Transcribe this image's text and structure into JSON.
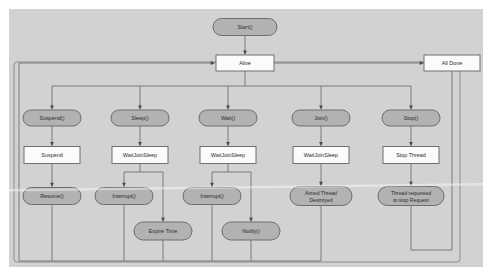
{
  "diagram": {
    "type": "flowchart",
    "canvas": {
      "background_color": "#d2d2d2",
      "page_background_color": "#ffffff",
      "frame_stroke_color": "#8c8c8c"
    },
    "style": {
      "rounded_node_fill": "#b2b2b2",
      "rect_node_fill": "#fbfbfb",
      "node_stroke": "#6e6e6e",
      "edge_color": "#7a7a7a"
    },
    "nodes": [
      {
        "id": "start",
        "label": "Start()",
        "shape": "rounded",
        "x": 245,
        "y": 27,
        "w": 64,
        "h": 17
      },
      {
        "id": "alive",
        "label": "Alive",
        "shape": "rect",
        "x": 245,
        "y": 63,
        "w": 58,
        "h": 16
      },
      {
        "id": "alldone",
        "label": "All Done",
        "shape": "rect",
        "x": 452,
        "y": 63,
        "w": 56,
        "h": 16
      },
      {
        "id": "suspend_call",
        "label": "Suspend()",
        "shape": "rounded",
        "x": 52,
        "y": 118,
        "w": 58,
        "h": 16
      },
      {
        "id": "sleep_call",
        "label": "Sleep()",
        "shape": "rounded",
        "x": 140,
        "y": 118,
        "w": 58,
        "h": 16
      },
      {
        "id": "wait_call",
        "label": "Wait()",
        "shape": "rounded",
        "x": 228,
        "y": 118,
        "w": 58,
        "h": 16
      },
      {
        "id": "join_call",
        "label": "Join()",
        "shape": "rounded",
        "x": 321,
        "y": 118,
        "w": 58,
        "h": 16
      },
      {
        "id": "stop_call",
        "label": "Stop()",
        "shape": "rounded",
        "x": 411,
        "y": 118,
        "w": 58,
        "h": 16
      },
      {
        "id": "suspend_st",
        "label": "Suspend",
        "shape": "rect",
        "x": 52,
        "y": 155,
        "w": 56,
        "h": 17
      },
      {
        "id": "wjs1",
        "label": "WaitJoinSleep",
        "shape": "rect",
        "x": 140,
        "y": 155,
        "w": 56,
        "h": 17
      },
      {
        "id": "wjs2",
        "label": "WaitJoinSleep",
        "shape": "rect",
        "x": 228,
        "y": 155,
        "w": 56,
        "h": 17
      },
      {
        "id": "wjs3",
        "label": "WaitJoinSleep",
        "shape": "rect",
        "x": 321,
        "y": 155,
        "w": 56,
        "h": 17
      },
      {
        "id": "stop_thread",
        "label": "Stop Thread",
        "shape": "rect",
        "x": 411,
        "y": 155,
        "w": 56,
        "h": 17
      },
      {
        "id": "resume_call",
        "label": "Resume()",
        "shape": "rounded",
        "x": 52,
        "y": 196,
        "w": 58,
        "h": 17
      },
      {
        "id": "interrupt1",
        "label": "Interrupt()",
        "shape": "rounded",
        "x": 124,
        "y": 196,
        "w": 58,
        "h": 17
      },
      {
        "id": "interrupt2",
        "label": "Interrupt()",
        "shape": "rounded",
        "x": 212,
        "y": 196,
        "w": 58,
        "h": 17
      },
      {
        "id": "aimed",
        "label": "Aimed Thread Destroyed",
        "shape": "rounded",
        "x": 321,
        "y": 196,
        "w": 62,
        "h": 19,
        "lines": [
          "Aimed Thread",
          "Destroyed"
        ]
      },
      {
        "id": "stopreq",
        "label": "Thread requested to stop Request",
        "shape": "rounded",
        "x": 411,
        "y": 196,
        "w": 66,
        "h": 19,
        "lines": [
          "Thread requested",
          "to stop Request"
        ]
      },
      {
        "id": "expire",
        "label": "Expire Time",
        "shape": "rounded",
        "x": 163,
        "y": 231,
        "w": 58,
        "h": 18
      },
      {
        "id": "notify",
        "label": "Notify()",
        "shape": "rounded",
        "x": 251,
        "y": 231,
        "w": 58,
        "h": 18
      }
    ],
    "edges": [
      {
        "from": "start",
        "to": "alive",
        "label": ""
      },
      {
        "from": "alive",
        "to": "alldone",
        "label": ""
      },
      {
        "from": "alive",
        "to": "suspend_call",
        "label": ""
      },
      {
        "from": "alive",
        "to": "sleep_call",
        "label": ""
      },
      {
        "from": "alive",
        "to": "wait_call",
        "label": ""
      },
      {
        "from": "alive",
        "to": "join_call",
        "label": ""
      },
      {
        "from": "alive",
        "to": "stop_call",
        "label": ""
      },
      {
        "from": "suspend_call",
        "to": "suspend_st",
        "label": ""
      },
      {
        "from": "sleep_call",
        "to": "wjs1",
        "label": ""
      },
      {
        "from": "wait_call",
        "to": "wjs2",
        "label": ""
      },
      {
        "from": "join_call",
        "to": "wjs3",
        "label": ""
      },
      {
        "from": "stop_call",
        "to": "stop_thread",
        "label": ""
      },
      {
        "from": "suspend_st",
        "to": "resume_call",
        "label": ""
      },
      {
        "from": "wjs1",
        "to": "interrupt1",
        "label": ""
      },
      {
        "from": "wjs1",
        "to": "expire",
        "label": ""
      },
      {
        "from": "wjs2",
        "to": "interrupt2",
        "label": ""
      },
      {
        "from": "wjs2",
        "to": "notify",
        "label": ""
      },
      {
        "from": "wjs3",
        "to": "aimed",
        "label": ""
      },
      {
        "from": "stop_thread",
        "to": "stopreq",
        "label": ""
      },
      {
        "from": "resume_call",
        "to": "alive",
        "label": ""
      },
      {
        "from": "interrupt1",
        "to": "alive",
        "label": ""
      },
      {
        "from": "expire",
        "to": "alive",
        "label": ""
      },
      {
        "from": "interrupt2",
        "to": "alive",
        "label": ""
      },
      {
        "from": "notify",
        "to": "alive",
        "label": ""
      },
      {
        "from": "aimed",
        "to": "alive",
        "label": ""
      },
      {
        "from": "stopreq",
        "to": "alldone",
        "label": ""
      }
    ]
  }
}
